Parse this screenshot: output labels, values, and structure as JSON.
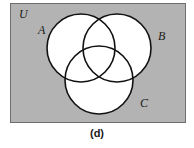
{
  "figure": {
    "caption": "(d)",
    "type": "venn-diagram",
    "set_count": 3
  },
  "universe": {
    "label": "U",
    "background_color": "#b3b3b3",
    "border_color": "#6e6e6e",
    "rect": {
      "x": 10,
      "y": 3,
      "width": 176,
      "height": 120
    }
  },
  "sets": [
    {
      "label": "A",
      "circle": {
        "cx": 81,
        "cy": 48,
        "r": 34
      },
      "fill": "#ffffff",
      "stroke": "#111111",
      "label_pos": {
        "x": 38,
        "y": 24
      }
    },
    {
      "label": "B",
      "circle": {
        "cx": 117,
        "cy": 48,
        "r": 34
      },
      "fill": "#ffffff",
      "stroke": "#111111",
      "label_pos": {
        "x": 158,
        "y": 30
      }
    },
    {
      "label": "C",
      "circle": {
        "cx": 99,
        "cy": 80,
        "r": 34
      },
      "fill": "#ffffff",
      "stroke": "#111111",
      "label_pos": {
        "x": 140,
        "y": 97
      }
    }
  ],
  "style": {
    "stroke_width": 1.6,
    "circle_fill": "#ffffff",
    "circle_stroke": "#111111",
    "text_color": "#1a1a1a"
  }
}
